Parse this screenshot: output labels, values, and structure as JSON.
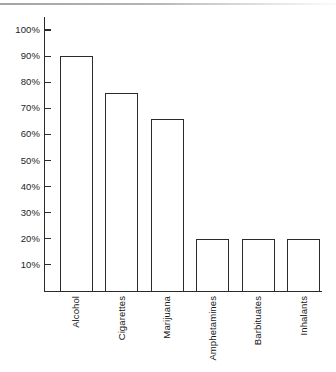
{
  "chart_data": {
    "type": "bar",
    "title": "",
    "subtitle": "",
    "xlabel": "",
    "ylabel": "",
    "categories": [
      "Alcohol",
      "Cigarettes",
      "Marijuana",
      "Amphetamines",
      "Barbituates",
      "Inhalants"
    ],
    "values": [
      90,
      76,
      66,
      20,
      20,
      20
    ],
    "value_labels": [
      "90%",
      "76%",
      "66%",
      "20%",
      "20%",
      "20%"
    ],
    "ylim": [
      0,
      100
    ],
    "ytick_values": [
      10,
      20,
      30,
      40,
      50,
      60,
      70,
      80,
      90,
      100
    ],
    "ytick_labels": [
      "10%",
      "20%",
      "30%",
      "40%",
      "50%",
      "60%",
      "70%",
      "80%",
      "90%",
      "100%"
    ],
    "grid": false,
    "legend": null,
    "legend_position": "none",
    "annotations": [],
    "bar_style": {
      "fill": "#ffffff",
      "outline": "#2b2b2b",
      "outline_width_px": 1.4
    },
    "axis_color": "#2b2b2b",
    "background": "#ffffff",
    "label_rotation_deg": -90
  },
  "figure": {
    "scan_artifact_name": "page-edge-line"
  }
}
